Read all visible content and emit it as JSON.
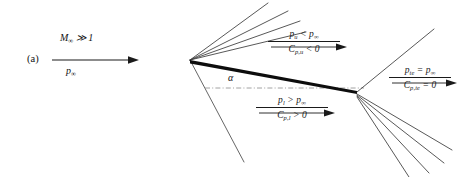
{
  "figure": {
    "panel_letter": "(a)",
    "background_color": "#ffffff",
    "line_color": "#2b2b2b",
    "plate_color": "#0d0d0d",
    "width": 464,
    "height": 177
  },
  "freestream": {
    "mach_label_html": "M<sub>∞</sub> ≫ 1",
    "pressure_label_html": "p<sub>∞</sub>",
    "mach_text": "M∞ ≫ 1",
    "pressure_text": "p∞",
    "arrow_name": "freestream-arrow"
  },
  "angle": {
    "symbol": "α",
    "name": "angle-of-attack-label"
  },
  "upper_surface": {
    "pressure_html": "p<sub>u</sub> &lt; p<sub>∞</sub>",
    "coefficient_html": "C<sub>p,u</sub> &lt; 0",
    "pressure_text": "p_u < p∞",
    "coefficient_text": "C_p,u < 0"
  },
  "lower_surface": {
    "pressure_html": "p<sub>l</sub> &gt; p<sub>∞</sub>",
    "coefficient_html": "C<sub>p,l</sub> &gt; 0",
    "pressure_text": "p_l > p∞",
    "coefficient_text": "C_p,l > 0"
  },
  "trailing_edge": {
    "pressure_html": "p<sub>te</sub> = p<sub>∞</sub>",
    "coefficient_html": "C<sub>p,te</sub> = 0",
    "pressure_text": "p_te = p∞",
    "coefficient_text": "C_p,te = 0"
  },
  "geometry": {
    "leading_edge": {
      "x": 190,
      "y": 60
    },
    "trailing_edge": {
      "x": 356,
      "y": 92
    },
    "le_expansion_fan": [
      {
        "x2": 268,
        "y2": 3
      },
      {
        "x2": 287,
        "y2": 10
      },
      {
        "x2": 300,
        "y2": 20
      },
      {
        "x2": 305,
        "y2": 30
      }
    ],
    "le_shock": {
      "x2": 243,
      "y2": 160
    },
    "te_shock": {
      "x2": 433,
      "y2": 30
    },
    "te_expansion_fan": [
      {
        "x2": 448,
        "y2": 152
      },
      {
        "x2": 440,
        "y2": 164
      },
      {
        "x2": 425,
        "y2": 172
      },
      {
        "x2": 406,
        "y2": 177
      }
    ],
    "chord_dashdot": {
      "x1": 206,
      "y1": 88,
      "x2": 362,
      "y2": 88
    }
  }
}
